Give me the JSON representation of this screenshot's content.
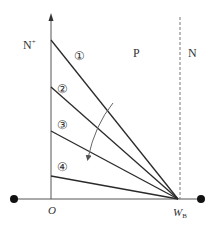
{
  "diagram": {
    "title": "",
    "colors": {
      "line": "#2a2a2a",
      "axis": "#555555",
      "dashed": "#777777",
      "text": "#333333",
      "arrow": "#666666",
      "dot": "#111111"
    },
    "regions": {
      "n_plus": "N",
      "n_plus_sup": "+",
      "p": "P",
      "n": "N"
    },
    "axis": {
      "origin_label": "O",
      "wb_label": "W",
      "wb_sub": "B"
    },
    "curves": [
      {
        "id": 1,
        "label": "①",
        "y_start": 40
      },
      {
        "id": 2,
        "label": "②",
        "y_start": 87
      },
      {
        "id": 3,
        "label": "③",
        "y_start": 131
      },
      {
        "id": 4,
        "label": "④",
        "y_start": 176
      }
    ],
    "arrow_direction": "decreasing"
  }
}
